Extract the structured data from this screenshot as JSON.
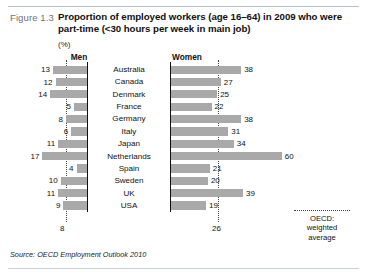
{
  "figure": {
    "label": "Figure 1.3",
    "title": "Proportion of employed workers (age 16–64) in 2009 who were part-time (<30 hours per week in main job)",
    "unit": "(%)",
    "source": "Source: OECD Employment Outlook 2010"
  },
  "legend": {
    "line1": "OECD:",
    "line2": "weighted",
    "line3": "average"
  },
  "headers": {
    "men": "Men",
    "women": "Women"
  },
  "reference": {
    "men_label": "8",
    "women_label": "26"
  },
  "colors": {
    "bar": "#a9a9a9",
    "axis": "#111111",
    "reference_line": "#444444",
    "figure_label": "#6d7278"
  },
  "chart_data": {
    "type": "bar",
    "title": "Proportion of employed workers (age 16–64) in 2009 who were part-time (<30 hours per week in main job)",
    "subtitle": "",
    "xlabel": "(%)",
    "ylabel": "",
    "orientation": "horizontal",
    "layout": "butterfly",
    "grid": false,
    "legend_position": "bottom-right",
    "annotations": [
      "OECD: weighted average (men) = 8",
      "OECD: weighted average (women) = 26"
    ],
    "reference_lines": [
      {
        "series": "Men",
        "value": 8
      },
      {
        "series": "Women",
        "value": 26
      }
    ],
    "xlim_men": [
      0,
      20
    ],
    "xlim_women": [
      0,
      65
    ],
    "categories": [
      "Australia",
      "Canada",
      "Denmark",
      "France",
      "Germany",
      "Italy",
      "Japan",
      "Netherlands",
      "Spain",
      "Sweden",
      "UK",
      "USA"
    ],
    "series": [
      {
        "name": "Men",
        "values": [
          13,
          12,
          14,
          5,
          8,
          6,
          11,
          17,
          4,
          10,
          11,
          9
        ]
      },
      {
        "name": "Women",
        "values": [
          38,
          27,
          25,
          22,
          38,
          31,
          34,
          60,
          21,
          20,
          39,
          19
        ]
      }
    ]
  }
}
